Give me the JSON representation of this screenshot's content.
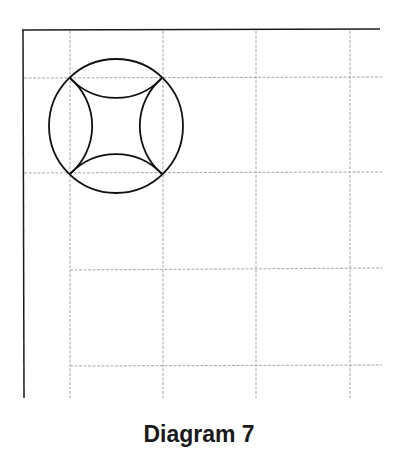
{
  "caption": "Diagram 7",
  "colors": {
    "border": "#1a1a1a",
    "grid": "#a8a8a8",
    "shape": "#111111",
    "background": "#ffffff"
  },
  "grid": {
    "vertical_x": [
      70,
      163,
      256,
      350
    ],
    "horizontal_y": [
      78,
      172,
      268,
      365
    ],
    "dashed": true
  },
  "frame": {
    "left_x": 23,
    "top_y": 30,
    "right_end_x": 380,
    "bottom_end_y": 398
  },
  "shape": {
    "description": "Circle circumscribing a grid square, with four concave arcs forming a curved star inside",
    "circle": {
      "cx": 116,
      "cy": 126,
      "r": 67
    },
    "square_corners": [
      [
        70,
        78
      ],
      [
        162,
        78
      ],
      [
        162,
        174
      ],
      [
        70,
        174
      ]
    ],
    "inner_arc_radius": 63
  }
}
